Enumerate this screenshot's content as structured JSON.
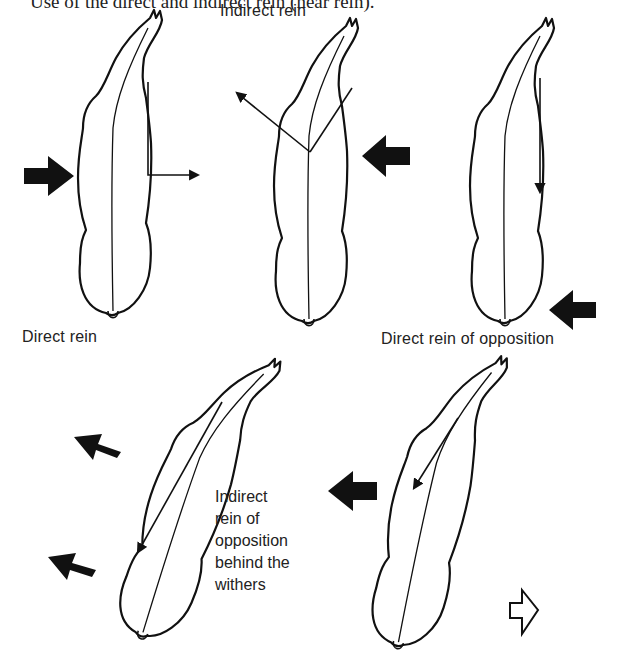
{
  "caption": "Use of the direct and indirect rein (near rein).",
  "figures": [
    {
      "id": "direct-rein",
      "label": "Direct rein"
    },
    {
      "id": "indirect-rein",
      "label": "Indirect rein"
    },
    {
      "id": "direct-rein-of-opposition",
      "label": "Direct rein of opposition"
    },
    {
      "id": "indirect-rein-of-opposition-behind-withers",
      "label_lines": [
        "Indirect",
        "rein of",
        "opposition",
        "behind the",
        "withers"
      ]
    },
    {
      "id": "indirect-rein-of-opposition-in-front-of-withers",
      "label": ""
    }
  ],
  "icons": {
    "solid_arrow": "solid-black-arrow",
    "rein_arrow": "thin-line-arrow",
    "open_arrow": "outlined-arrow-right"
  },
  "colors": {
    "ink": "#111111",
    "background": "#ffffff"
  }
}
